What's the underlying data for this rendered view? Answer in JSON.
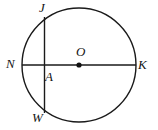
{
  "figure": {
    "type": "circle-geometry-diagram",
    "width": 158,
    "height": 130,
    "background_color": "#ffffff",
    "stroke_color": "#1a1a1a",
    "label_color": "#141414"
  },
  "circle": {
    "name": "circle-O",
    "center_x": 79,
    "center_y": 65,
    "radius": 57,
    "stroke_width": 1.4
  },
  "center_point": {
    "label": "O",
    "dot_x": 79,
    "dot_y": 65,
    "dot_radius": 2.6
  },
  "segments": [
    {
      "name": "diameter-NK",
      "x1": 22,
      "y1": 65,
      "x2": 136,
      "y2": 65,
      "stroke_width": 1.4
    },
    {
      "name": "chord-JW",
      "x1": 44.5,
      "y1": 17,
      "x2": 44.5,
      "y2": 113,
      "stroke_width": 1.4
    }
  ],
  "labels": {
    "J": "J",
    "N": "N",
    "K": "K",
    "W": "W",
    "O": "O",
    "A": "A"
  }
}
